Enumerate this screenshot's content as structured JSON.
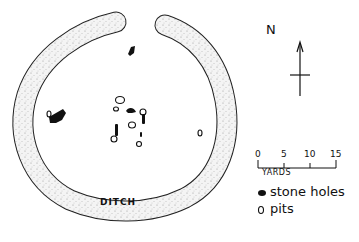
{
  "diagram": {
    "type": "archaeological site plan",
    "ring": {
      "label": "DITCH"
    },
    "north_arrow": {
      "label": "N"
    },
    "scale_bar": {
      "ticks": [
        "0",
        "5",
        "10",
        "15"
      ],
      "unit": "YARDS"
    },
    "legend": [
      {
        "symbol": "filled-blob",
        "label": "stone holes"
      },
      {
        "symbol": "open-circle",
        "label": "pits"
      }
    ],
    "colors": {
      "ink": "#111111",
      "ditch_fill": "#f2f2f2",
      "background": "#ffffff"
    }
  }
}
